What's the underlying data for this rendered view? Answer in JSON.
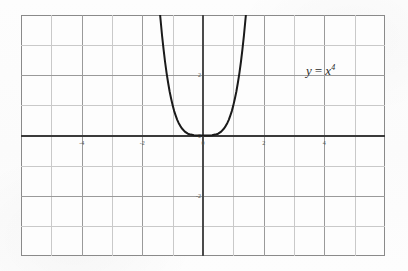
{
  "figure": {
    "background_color": "#fdfdfd",
    "frame_color": "#8a8a8a",
    "grid_color": "#c9c9c9",
    "axis_color": "#3a3a3a",
    "curve_color": "#1a1a1a"
  },
  "annotation": {
    "equation_y": "y",
    "equation_op": "=",
    "equation_base": "x",
    "equation_exponent": "4",
    "equation_full": "y = x^4"
  },
  "chart_data": {
    "type": "line",
    "title": "",
    "subtitle": "",
    "xlabel": "",
    "ylabel": "",
    "function": "y = x^4",
    "xlim": [
      -6,
      6
    ],
    "ylim": [
      -4,
      4
    ],
    "grid": true,
    "grid_step_x": 1,
    "grid_step_y": 1,
    "legend": "none",
    "annotations": [
      {
        "text": "y = x^4",
        "x": 4.35,
        "y": 2.05
      }
    ],
    "xticks": [
      -6,
      -5,
      -4,
      -3,
      -2,
      -1,
      0,
      1,
      2,
      3,
      4,
      5,
      6
    ],
    "yticks": [
      -4,
      -3,
      -2,
      -1,
      0,
      1,
      2,
      3,
      4
    ],
    "xtick_labels": [
      {
        "value": -4,
        "label": "-4"
      },
      {
        "value": -2,
        "label": "-2"
      },
      {
        "value": 0,
        "label": "0"
      },
      {
        "value": 2,
        "label": "2"
      },
      {
        "value": 4,
        "label": "4"
      }
    ],
    "ytick_labels": [
      {
        "value": 2,
        "label": "2"
      },
      {
        "value": 0,
        "label": "0"
      },
      {
        "value": -2,
        "label": "-2"
      }
    ],
    "series": [
      {
        "name": "y = x^4",
        "color": "#1a1a1a",
        "x": [
          -1.414,
          -1.35,
          -1.3,
          -1.25,
          -1.2,
          -1.15,
          -1.1,
          -1.05,
          -1.0,
          -0.95,
          -0.9,
          -0.85,
          -0.8,
          -0.75,
          -0.7,
          -0.6,
          -0.5,
          -0.4,
          -0.3,
          -0.2,
          -0.1,
          0,
          0.1,
          0.2,
          0.3,
          0.4,
          0.5,
          0.6,
          0.7,
          0.75,
          0.8,
          0.85,
          0.9,
          0.95,
          1.0,
          1.05,
          1.1,
          1.15,
          1.2,
          1.25,
          1.3,
          1.35,
          1.414
        ],
        "y": [
          4.0,
          3.32,
          2.86,
          2.44,
          2.07,
          1.75,
          1.46,
          1.22,
          1.0,
          0.81,
          0.66,
          0.52,
          0.41,
          0.32,
          0.24,
          0.13,
          0.06,
          0.03,
          0.01,
          0.002,
          0.0001,
          0,
          0.0001,
          0.002,
          0.01,
          0.03,
          0.06,
          0.13,
          0.24,
          0.32,
          0.41,
          0.52,
          0.66,
          0.81,
          1.0,
          1.22,
          1.46,
          1.75,
          2.07,
          2.44,
          2.86,
          3.32,
          4.0
        ]
      }
    ]
  }
}
